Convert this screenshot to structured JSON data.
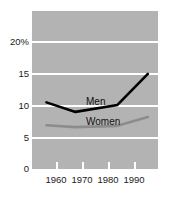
{
  "chart_data": {
    "type": "line",
    "title": "",
    "subtitle": "",
    "xlabel": "",
    "ylabel": "",
    "xlim": [
      1955,
      1998.5
    ],
    "ylim": [
      0,
      24.9
    ],
    "grid": true,
    "grid_orientation": "horizontal",
    "legend_position": "inline-annotation",
    "plot_background": "#b3b3b3",
    "gridline_color": "#ffffff",
    "x_ticks": [
      1960,
      1970,
      1980,
      1990
    ],
    "x_tick_labels": [
      "1960",
      "1970",
      "1980",
      "1990"
    ],
    "y_ticks": [
      0,
      5,
      10,
      15,
      20
    ],
    "y_tick_labels": [
      "0",
      "5",
      "10",
      "15",
      "20%"
    ],
    "series": [
      {
        "name": "Men",
        "color": "#000000",
        "line_width": 2.6,
        "x": [
          1960,
          1970,
          1984.5,
          1995
        ],
        "values": [
          10.5,
          9.0,
          10.1,
          15.0
        ]
      },
      {
        "name": "Women",
        "color": "#8c8c8c",
        "line_width": 2.6,
        "x": [
          1960,
          1970,
          1984.5,
          1995
        ],
        "values": [
          6.9,
          6.6,
          6.8,
          8.2
        ]
      }
    ],
    "annotations": [
      {
        "text": "Men",
        "series": "Men"
      },
      {
        "text": "Women",
        "series": "Women"
      }
    ]
  }
}
